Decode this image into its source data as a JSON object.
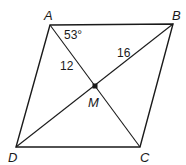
{
  "figure": {
    "type": "parallelogram",
    "vertices": [
      "A",
      "B",
      "C",
      "D"
    ],
    "diagonal_intersection": "M",
    "labels": {
      "A": "A",
      "B": "B",
      "C": "C",
      "D": "D",
      "M": "M"
    },
    "annotations": {
      "angle_at_A": "53°",
      "segment_AM": "12",
      "segment_BM": "16"
    }
  }
}
